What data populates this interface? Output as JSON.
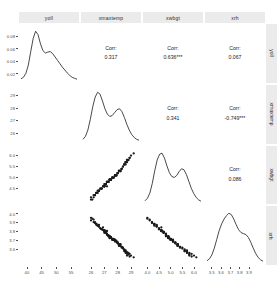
{
  "chart_data": {
    "type": "scatter",
    "plot_kind": "scatterplot-matrix",
    "title": "",
    "variables": [
      "yoll",
      "xmaxtemp",
      "xwbgt",
      "xrh"
    ],
    "grid": false,
    "legend": "none",
    "diagonal": "density",
    "upper": "correlation-text",
    "lower": "scatter-points",
    "correlation_label": "Corr:",
    "correlations": [
      {
        "row": "yoll",
        "col": "xmaxtemp",
        "value": "0.317",
        "stars": ""
      },
      {
        "row": "yoll",
        "col": "xwbgt",
        "value": "0.636",
        "stars": "***"
      },
      {
        "row": "yoll",
        "col": "xrh",
        "value": "0.067",
        "stars": ""
      },
      {
        "row": "xmaxtemp",
        "col": "xwbgt",
        "value": "0.341",
        "stars": ""
      },
      {
        "row": "xmaxtemp",
        "col": "xrh",
        "value": "-0.749",
        "stars": "***"
      },
      {
        "row": "xwbgt",
        "col": "xrh",
        "value": "0.086",
        "stars": ""
      }
    ],
    "axes": [
      {
        "name": "yoll",
        "ylim": [
          0.01,
          0.095
        ],
        "xlim": [
          38,
          57
        ],
        "yticks": [
          "0.08",
          "0.06",
          "0.04",
          "0.02"
        ],
        "ytick_values": [
          0.08,
          0.06,
          0.04,
          0.02
        ],
        "xticks": [
          "40",
          "45",
          "50",
          "55"
        ],
        "xtick_values": [
          40,
          45,
          50,
          55
        ]
      },
      {
        "name": "xmaxtemp",
        "ylim": [
          25.4,
          29.6
        ],
        "xlim": [
          25.4,
          29.6
        ],
        "yticks": [
          "29",
          "28",
          "27",
          "26"
        ],
        "ytick_values": [
          29,
          28,
          27,
          26
        ],
        "xticks": [
          "26",
          "27",
          "28",
          "29"
        ],
        "xtick_values": [
          26,
          27,
          28,
          29
        ]
      },
      {
        "name": "xwbgt",
        "ylim": [
          3.9,
          6.3
        ],
        "xlim": [
          3.9,
          6.3
        ],
        "yticks": [
          "6.0",
          "5.5",
          "5.0",
          "4.5"
        ],
        "ytick_values": [
          6.0,
          5.5,
          5.0,
          4.5
        ],
        "xticks": [
          "4.0",
          "4.5",
          "5.0",
          "5.5",
          "6.0"
        ],
        "xtick_values": [
          4.0,
          4.5,
          5.0,
          5.5,
          6.0
        ]
      },
      {
        "name": "xrh",
        "ylim": [
          3.45,
          4.05
        ],
        "xlim": [
          3.45,
          4.05
        ],
        "yticks": [
          "4.0",
          "3.9",
          "3.8",
          "3.7",
          "3.6"
        ],
        "ytick_values": [
          4.0,
          3.9,
          3.8,
          3.7,
          3.6
        ],
        "xticks": [
          "3.5",
          "3.6",
          "3.7",
          "3.8",
          "3.9"
        ],
        "xtick_values": [
          3.5,
          3.6,
          3.7,
          3.8,
          3.9
        ]
      }
    ],
    "data": {
      "yoll": [
        0.047,
        0.033,
        0.055,
        0.041,
        0.062,
        0.028,
        0.05,
        0.038,
        0.071,
        0.044,
        0.031,
        0.058,
        0.036,
        0.049,
        0.066,
        0.042,
        0.029,
        0.053,
        0.039,
        0.061,
        0.034,
        0.046,
        0.057,
        0.03,
        0.043,
        0.068,
        0.037,
        0.051,
        0.025,
        0.059,
        0.04,
        0.048,
        0.064,
        0.032,
        0.054,
        0.045,
        0.027,
        0.06,
        0.035,
        0.052,
        0.07,
        0.042,
        0.038,
        0.056,
        0.031,
        0.049,
        0.044,
        0.063,
        0.029,
        0.047,
        0.039,
        0.058,
        0.034,
        0.051,
        0.041,
        0.067,
        0.036,
        0.046,
        0.026,
        0.055,
        0.043,
        0.03,
        0.062,
        0.048,
        0.037,
        0.053,
        0.045,
        0.028,
        0.059,
        0.04,
        0.065,
        0.033,
        0.05,
        0.042,
        0.057,
        0.035,
        0.046,
        0.031,
        0.061,
        0.044,
        0.039,
        0.054,
        0.027,
        0.049,
        0.043,
        0.066,
        0.037,
        0.052,
        0.032,
        0.058,
        0.041,
        0.047,
        0.03,
        0.06,
        0.038,
        0.055,
        0.045,
        0.026,
        0.063,
        0.048
      ],
      "xmaxtemp": [
        27.4,
        26.8,
        28.1,
        27.0,
        28.6,
        26.4,
        27.8,
        27.2,
        29.0,
        27.6,
        26.6,
        28.3,
        26.9,
        27.5,
        28.8,
        27.3,
        26.2,
        28.0,
        27.1,
        28.5,
        26.7,
        27.7,
        28.2,
        26.5,
        27.4,
        28.9,
        27.0,
        27.9,
        26.0,
        28.4,
        27.2,
        27.6,
        28.7,
        26.8,
        28.1,
        27.5,
        26.3,
        28.6,
        27.1,
        28.0,
        29.2,
        27.3,
        27.0,
        28.2,
        26.6,
        27.8,
        27.4,
        28.5,
        26.4,
        27.7,
        27.1,
        28.3,
        26.9,
        27.9,
        27.2,
        28.8,
        27.0,
        27.6,
        26.1,
        28.1,
        27.4,
        26.5,
        28.6,
        27.8,
        27.1,
        28.0,
        27.5,
        26.3,
        28.4,
        27.2,
        28.7,
        26.7,
        27.9,
        27.3,
        28.2,
        27.0,
        27.6,
        26.6,
        28.5,
        27.4,
        27.1,
        28.1,
        26.2,
        27.8,
        27.3,
        28.9,
        27.0,
        28.0,
        26.8,
        28.3,
        27.2,
        27.7,
        26.4,
        28.6,
        27.1,
        28.2,
        27.5,
        26.0,
        28.7,
        27.8
      ],
      "xwbgt": [
        4.9,
        4.5,
        5.3,
        4.7,
        5.7,
        4.3,
        5.1,
        4.6,
        6.0,
        5.0,
        4.4,
        5.4,
        4.6,
        4.9,
        5.8,
        4.8,
        4.2,
        5.2,
        4.7,
        5.6,
        4.5,
        5.0,
        5.3,
        4.3,
        4.9,
        5.9,
        4.6,
        5.1,
        4.1,
        5.5,
        4.8,
        5.0,
        5.7,
        4.5,
        5.3,
        4.9,
        4.2,
        5.6,
        4.7,
        5.2,
        6.1,
        4.8,
        4.6,
        5.3,
        4.4,
        5.1,
        4.9,
        5.6,
        4.3,
        5.0,
        4.7,
        5.4,
        4.6,
        5.1,
        4.8,
        5.8,
        4.6,
        5.0,
        4.0,
        5.3,
        4.9,
        4.4,
        5.7,
        5.1,
        4.7,
        5.2,
        4.9,
        4.2,
        5.5,
        4.8,
        5.8,
        4.5,
        5.1,
        4.8,
        5.3,
        4.6,
        5.0,
        4.4,
        5.6,
        4.9,
        4.7,
        5.3,
        4.1,
        5.1,
        4.8,
        5.9,
        4.6,
        5.2,
        4.5,
        5.4,
        4.8,
        5.0,
        4.3,
        5.7,
        4.7,
        5.3,
        4.9,
        4.0,
        5.8,
        5.1
      ],
      "xrh": [
        3.72,
        3.82,
        3.64,
        3.78,
        3.58,
        3.88,
        3.68,
        3.8,
        3.52,
        3.7,
        3.85,
        3.62,
        3.81,
        3.73,
        3.55,
        3.75,
        3.9,
        3.66,
        3.79,
        3.59,
        3.83,
        3.71,
        3.65,
        3.86,
        3.74,
        3.54,
        3.8,
        3.69,
        3.92,
        3.61,
        3.76,
        3.7,
        3.56,
        3.82,
        3.63,
        3.72,
        3.89,
        3.57,
        3.79,
        3.67,
        3.5,
        3.75,
        3.81,
        3.64,
        3.87,
        3.69,
        3.73,
        3.58,
        3.88,
        3.7,
        3.78,
        3.62,
        3.84,
        3.68,
        3.76,
        3.53,
        3.8,
        3.71,
        3.94,
        3.65,
        3.74,
        3.86,
        3.55,
        3.69,
        3.79,
        3.66,
        3.73,
        3.9,
        3.6,
        3.77,
        3.52,
        3.83,
        3.68,
        3.75,
        3.63,
        3.81,
        3.71,
        3.85,
        3.57,
        3.72,
        3.78,
        3.64,
        3.93,
        3.7,
        3.74,
        3.51,
        3.8,
        3.67,
        3.82,
        3.61,
        3.76,
        3.7,
        3.87,
        3.56,
        3.79,
        3.65,
        3.73,
        3.95,
        3.54,
        3.69
      ]
    },
    "densities": {
      "yoll": [
        0.02,
        0.05,
        0.13,
        0.3,
        0.58,
        0.85,
        1.0,
        0.93,
        0.74,
        0.6,
        0.55,
        0.57,
        0.58,
        0.54,
        0.47,
        0.4,
        0.33,
        0.26,
        0.2,
        0.14,
        0.09,
        0.05,
        0.03,
        0.01
      ],
      "xmaxtemp": [
        0.03,
        0.09,
        0.22,
        0.44,
        0.7,
        0.9,
        1.0,
        0.96,
        0.82,
        0.66,
        0.55,
        0.5,
        0.52,
        0.58,
        0.64,
        0.66,
        0.6,
        0.48,
        0.34,
        0.22,
        0.13,
        0.07,
        0.03,
        0.01
      ],
      "xwbgt": [
        0.02,
        0.07,
        0.18,
        0.38,
        0.64,
        0.86,
        0.98,
        1.0,
        0.9,
        0.74,
        0.6,
        0.52,
        0.5,
        0.54,
        0.62,
        0.68,
        0.66,
        0.56,
        0.42,
        0.28,
        0.17,
        0.09,
        0.04,
        0.01
      ],
      "xrh": [
        0.02,
        0.06,
        0.14,
        0.28,
        0.46,
        0.64,
        0.78,
        0.88,
        0.95,
        1.0,
        0.97,
        0.88,
        0.76,
        0.66,
        0.6,
        0.58,
        0.56,
        0.5,
        0.4,
        0.28,
        0.17,
        0.09,
        0.04,
        0.01
      ]
    },
    "point_color": "#1a1a1a",
    "line_color": "#1a1a1a",
    "panel_background": "#ffffff",
    "strip_background": "#ebebeb"
  }
}
